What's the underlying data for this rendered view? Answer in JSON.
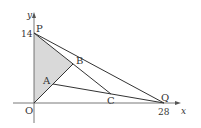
{
  "figure": {
    "axes": {
      "x_label": "x",
      "y_label": "y",
      "x_tick": "28",
      "y_tick": "14"
    },
    "points": {
      "O": {
        "label": "O",
        "coord": [
          0,
          0
        ]
      },
      "P": {
        "label": "P",
        "coord": [
          0,
          14
        ]
      },
      "Q": {
        "label": "Q",
        "coord": [
          28,
          0
        ]
      },
      "A": {
        "label": "A"
      },
      "B": {
        "label": "B"
      },
      "C": {
        "label": "C"
      }
    },
    "segments": [
      [
        "P",
        "Q"
      ],
      [
        "P",
        "C"
      ],
      [
        "O",
        "B"
      ],
      [
        "A",
        "Q"
      ]
    ],
    "shaded_region": [
      "O",
      "P",
      "B"
    ],
    "colors": {
      "line": "#333333",
      "axis": "#555555",
      "shade": "#d9d9d9"
    }
  }
}
